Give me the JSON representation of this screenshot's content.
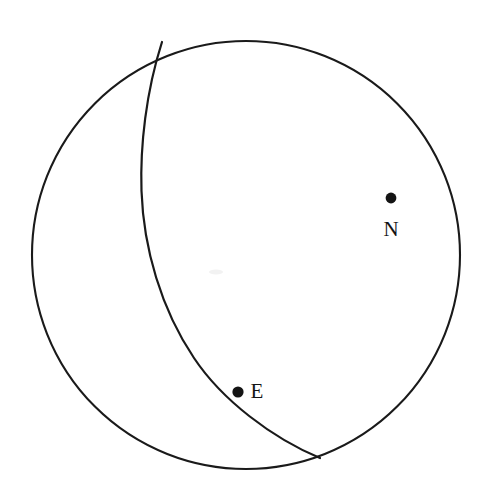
{
  "figure": {
    "name": "stereonet-projection",
    "background_color": "#ffffff",
    "stroke_color": "#1a1a1a",
    "marker_color": "#141414",
    "width": 484,
    "height": 502
  },
  "primitive": {
    "name": "primitive-circle",
    "center_x": 246,
    "center_y": 255,
    "radius": 214,
    "stroke_width": 2.1
  },
  "great_circle": {
    "name": "great-circle-arc",
    "start_x": 162,
    "start_y": 42,
    "end_x": 320,
    "end_y": 458,
    "leftmost_x": 141,
    "leftmost_y": 190,
    "path": "M 162 42 C 146 92 140 146 141.5 191 C 143.5 248 161 309 194 358 C 222 400 272 438 320 458",
    "stroke_width": 2.2
  },
  "points": [
    {
      "label": "N",
      "name": "point-n",
      "dot_x": 391,
      "dot_y": 198,
      "dot_radius": 5.4,
      "label_x": 391,
      "label_y": 236,
      "font_size": 21
    },
    {
      "label": "E",
      "name": "point-e",
      "dot_x": 238,
      "dot_y": 392,
      "dot_radius": 5.6,
      "label_x": 257,
      "label_y": 398,
      "font_size": 21
    }
  ],
  "artifacts": [
    {
      "name": "paper-smudge",
      "x": 216,
      "y": 272,
      "rx": 7,
      "ry": 2.5
    }
  ]
}
